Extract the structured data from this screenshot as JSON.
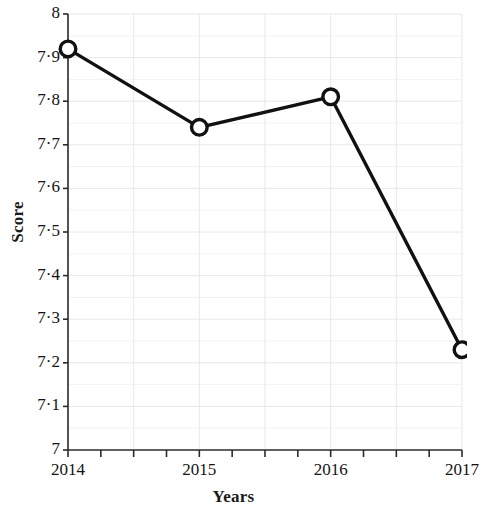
{
  "chart_data": {
    "type": "line",
    "title": "",
    "xlabel": "Years",
    "ylabel": "Score",
    "x": [
      2014,
      2015,
      2016,
      2017
    ],
    "categories": [
      "2014",
      "2015",
      "2016",
      "2017"
    ],
    "values": [
      7.92,
      7.74,
      7.81,
      7.23
    ],
    "series": [
      {
        "name": "Score",
        "values": [
          7.92,
          7.74,
          7.81,
          7.23
        ]
      }
    ],
    "xlim": [
      2014,
      2017
    ],
    "ylim": [
      7,
      8
    ],
    "ytick_values": [
      7,
      7.1,
      7.2,
      7.3,
      7.4,
      7.5,
      7.6,
      7.7,
      7.8,
      7.9,
      8
    ],
    "ytick_labels": [
      "7",
      "7·1",
      "7·2",
      "7·3",
      "7·4",
      "7·5",
      "7·6",
      "7·7",
      "7·8",
      "7·9",
      "8"
    ],
    "xtick_values": [
      2014,
      2015,
      2016,
      2017
    ],
    "xtick_labels": [
      "2014",
      "2015",
      "2016",
      "2017"
    ],
    "x_minor_ticks": [
      2014.25,
      2014.5,
      2014.75,
      2015.25,
      2015.5,
      2015.75,
      2016.25,
      2016.5,
      2016.75
    ],
    "grid": true,
    "grid_color": "#e8e8e8",
    "legend": "none",
    "marker": "open-circle",
    "line_color": "#111111",
    "marker_face_color": "#ffffff",
    "marker_edge_color": "#111111",
    "axis_color": "#2b2b2b",
    "spines": [
      "left",
      "bottom"
    ]
  },
  "axis_titles": {
    "y": "Score",
    "x": "Years"
  }
}
